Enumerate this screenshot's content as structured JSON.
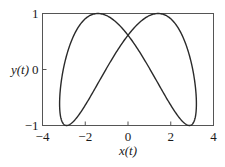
{
  "chart_data": {
    "type": "line",
    "title": "",
    "xlabel": "x(t)",
    "ylabel": "y(t)",
    "xlim": [
      -4,
      4
    ],
    "ylim": [
      -1,
      1
    ],
    "xticks": [
      -4,
      -2,
      0,
      2,
      4
    ],
    "xtick_labels": [
      "−4",
      "−2",
      "0",
      "2",
      "4"
    ],
    "yticks": [
      -1,
      0,
      1
    ],
    "ytick_labels": [
      "−1",
      "0",
      "1"
    ],
    "grid": false,
    "legend": null,
    "parametric": {
      "x": "3.2*cos(t)",
      "y": "cos(2t - 2.23)",
      "t_range": [
        0,
        6.2832
      ]
    },
    "key_points": [
      {
        "label": "top-left peak",
        "x": -1.5,
        "y": 1.0
      },
      {
        "label": "top-right peak",
        "x": 1.5,
        "y": 1.0
      },
      {
        "label": "bottom-left",
        "x": -2.85,
        "y": -1.0
      },
      {
        "label": "bottom-right",
        "x": 2.85,
        "y": -1.0
      },
      {
        "label": "leftmost",
        "x": -3.2,
        "y": -0.6
      },
      {
        "label": "rightmost",
        "x": 3.2,
        "y": -0.6
      },
      {
        "label": "self-intersection",
        "x": 0.0,
        "y": 0.6
      }
    ],
    "line_color": "#2a2a2a"
  }
}
